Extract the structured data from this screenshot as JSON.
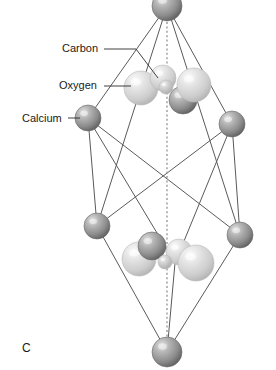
{
  "figure": {
    "panel_letter": "C",
    "width": 276,
    "height": 370,
    "background_color": "#ffffff"
  },
  "labels": [
    {
      "id": "carbon",
      "text": "Carbon",
      "x": 62,
      "y": 52,
      "anchor_x": 104,
      "anchor_y": 49
    },
    {
      "id": "oxygen",
      "text": "Oxygen",
      "x": 59,
      "y": 89,
      "anchor_x": 104,
      "anchor_y": 86
    },
    {
      "id": "calcium",
      "text": "Calcium",
      "x": 22,
      "y": 122,
      "anchor_x": 68,
      "anchor_y": 118
    }
  ],
  "leader_lines": [
    {
      "id": "carbon-leader",
      "points": "104,49 136,49 158,78"
    },
    {
      "id": "oxygen-leader",
      "points": "104,86 131,86"
    },
    {
      "id": "calcium-leader",
      "points": "68,118 80,118"
    }
  ],
  "colors": {
    "calcium_dark": "#8f8f8f",
    "calcium_highlight": "#d8d8d8",
    "calcium_shadow": "#5c5c5c",
    "oxygen_light": "#d2d2d2",
    "oxygen_highlight": "#f2f2f2",
    "oxygen_shadow": "#a6a6a6",
    "carbon_mid": "#c0c0c0",
    "carbon_highlight": "#e8e8e8",
    "edge_stroke": "#5a5a5a",
    "axis_stroke": "#9a9a9a",
    "text": "#1a1a1a"
  },
  "atom_legend": [
    {
      "element": "Calcium",
      "symbol": "Ca",
      "shade": "dark-gray"
    },
    {
      "element": "Carbon",
      "symbol": "C",
      "shade": "mid-gray-small"
    },
    {
      "element": "Oxygen",
      "symbol": "O",
      "shade": "light-gray-large"
    }
  ],
  "axis": {
    "id": "c-axis",
    "x": 167,
    "y_top": 0,
    "y_bottom": 352,
    "style": "dashed"
  },
  "cell_edges": [
    "167,6 88,118",
    "167,6 232,124",
    "167,6 97,226",
    "167,6 240,235",
    "88,118 97,226",
    "88,118 175,263",
    "232,124 240,235",
    "232,124 175,263",
    "97,226 167,352",
    "240,235 167,352",
    "175,263 167,352",
    "88,118 240,235",
    "232,124 97,226"
  ],
  "atoms": [
    {
      "id": "ca-top",
      "element": "calcium",
      "cx": 167,
      "cy": 6,
      "r": 15
    },
    {
      "id": "ca-left-upper",
      "element": "calcium",
      "cx": 88,
      "cy": 118,
      "r": 13
    },
    {
      "id": "ca-right-upper",
      "element": "calcium",
      "cx": 232,
      "cy": 124,
      "r": 13
    },
    {
      "id": "ca-left-lower",
      "element": "calcium",
      "cx": 97,
      "cy": 226,
      "r": 13
    },
    {
      "id": "ca-right-lower",
      "element": "calcium",
      "cx": 240,
      "cy": 235,
      "r": 13
    },
    {
      "id": "ca-bottom",
      "element": "calcium",
      "cx": 167,
      "cy": 352,
      "r": 15
    },
    {
      "id": "ca-mid-upper",
      "element": "calcium",
      "cx": 183,
      "cy": 100,
      "r": 14
    },
    {
      "id": "ca-mid-lower",
      "element": "calcium",
      "cx": 152,
      "cy": 246,
      "r": 14
    },
    {
      "id": "o-upper-left",
      "element": "oxygen",
      "cx": 141,
      "cy": 88,
      "r": 17
    },
    {
      "id": "o-upper-back",
      "element": "oxygen",
      "cx": 163,
      "cy": 78,
      "r": 13
    },
    {
      "id": "o-upper-right",
      "element": "oxygen",
      "cx": 194,
      "cy": 85,
      "r": 17
    },
    {
      "id": "c-upper",
      "element": "carbon",
      "cx": 166,
      "cy": 87,
      "r": 7
    },
    {
      "id": "o-lower-left",
      "element": "oxygen",
      "cx": 139,
      "cy": 259,
      "r": 17
    },
    {
      "id": "o-lower-back",
      "element": "oxygen",
      "cx": 179,
      "cy": 252,
      "r": 13
    },
    {
      "id": "o-lower-right",
      "element": "oxygen",
      "cx": 196,
      "cy": 263,
      "r": 18
    },
    {
      "id": "c-lower",
      "element": "carbon",
      "cx": 165,
      "cy": 262,
      "r": 7
    }
  ]
}
